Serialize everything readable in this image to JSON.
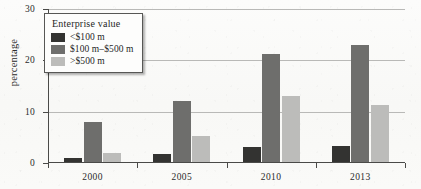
{
  "chart_data": {
    "type": "bar",
    "title": "",
    "xlabel": "",
    "ylabel": "percentage",
    "categories": [
      "2000",
      "2005",
      "2010",
      "2013"
    ],
    "ylim": [
      0,
      30
    ],
    "yticks": [
      0,
      10,
      20,
      30
    ],
    "ytick_labels": [
      "0",
      "10",
      "20",
      "30"
    ],
    "grid": true,
    "legend_position": "top-left",
    "legend_title": "Enterprise value",
    "series": [
      {
        "name": "<$100 m",
        "color": "#333331",
        "values": [
          0.7,
          1.5,
          2.9,
          3.1
        ]
      },
      {
        "name": "$100 m–$500 m",
        "color": "#6e6e6c",
        "values": [
          7.7,
          11.8,
          21.0,
          22.8
        ]
      },
      {
        "name": ">$500 m",
        "color": "#bcbcba",
        "values": [
          1.7,
          5.0,
          12.9,
          11.2
        ]
      }
    ]
  },
  "axis": {
    "y_label": "percentage"
  },
  "legend": {
    "title": "Enterprise value"
  }
}
